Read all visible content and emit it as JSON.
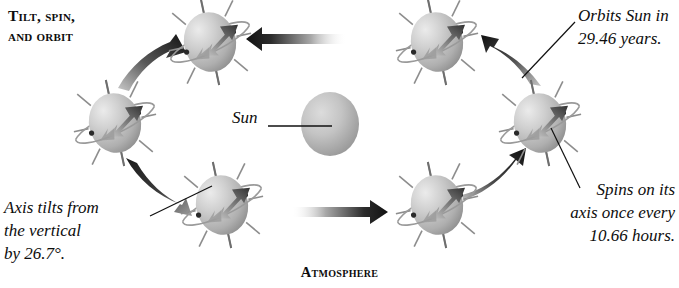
{
  "figure": {
    "section_title": "Tilt, spin,\nand orbit",
    "caption": "Atmosphere",
    "background_color": "#ffffff",
    "text_color": "#0d0d0d"
  },
  "sun": {
    "label": "Sun",
    "center": {
      "x": 330,
      "y": 124
    },
    "radius": 29,
    "fill_light": "#d7d7d7",
    "fill_dark": "#8f8f8f",
    "leader_line": {
      "x1": 268,
      "y1": 126,
      "x2": 330,
      "y2": 126
    }
  },
  "annotations": [
    {
      "name": "orbit-period",
      "text": "Orbits Sun in\n29.46 years.",
      "align": "left",
      "leader_line": {
        "x1": 522,
        "y1": 78,
        "x2": 575,
        "y2": 20
      }
    },
    {
      "name": "spin-period",
      "text": "Spins on its\naxis once every\n10.66 hours.",
      "align": "right",
      "leader_line": {
        "x1": 551,
        "y1": 128,
        "x2": 580,
        "y2": 188
      }
    },
    {
      "name": "axis-tilt",
      "text": "Axis tilts from\nthe vertical\nby 26.7°.",
      "align": "left",
      "leader_line": {
        "x1": 210,
        "y1": 186,
        "x2": 152,
        "y2": 216
      }
    }
  ],
  "planets": [
    {
      "name": "planet-top-left",
      "cx": 210,
      "cy": 42,
      "rx": 26,
      "ry": 30
    },
    {
      "name": "planet-top-right",
      "cx": 437,
      "cy": 42,
      "rx": 26,
      "ry": 30
    },
    {
      "name": "planet-right",
      "cx": 540,
      "cy": 123,
      "rx": 26,
      "ry": 30
    },
    {
      "name": "planet-bottom-right",
      "cx": 437,
      "cy": 205,
      "rx": 26,
      "ry": 30
    },
    {
      "name": "planet-bottom-left",
      "cx": 222,
      "cy": 205,
      "rx": 26,
      "ry": 30
    },
    {
      "name": "planet-left",
      "cx": 115,
      "cy": 123,
      "rx": 26,
      "ry": 30
    }
  ],
  "planet_style": {
    "sphere_light": "#e3e3e3",
    "sphere_mid": "#bfbfbf",
    "sphere_dark": "#8d8d8d",
    "axis_color": "#6e6e6e",
    "spoke_color": "#8a8a8a",
    "ring_color": "#9a9a9a",
    "spin_arrow_dark": "#3a3a3a",
    "spin_arrow_light": "#a8a8a8",
    "axis_tilt_degrees": 26.7
  },
  "orbit_arrows": [
    {
      "name": "orbit-arrow-top",
      "direction": "left",
      "style": "straight",
      "gradient": "dark-at-head-left"
    },
    {
      "name": "orbit-arrow-bottom",
      "direction": "right",
      "style": "straight",
      "gradient": "dark-at-head-right"
    },
    {
      "name": "orbit-arrow-upper-left",
      "direction": "up-right",
      "style": "curved",
      "gradient": "dark-at-head"
    },
    {
      "name": "orbit-arrow-lower-left",
      "direction": "down-right",
      "style": "curved",
      "gradient": "dark-at-head"
    },
    {
      "name": "orbit-arrow-upper-right",
      "direction": "up-left",
      "style": "curved",
      "gradient": "dark-at-head"
    },
    {
      "name": "orbit-arrow-lower-right",
      "direction": "up-right",
      "style": "curved",
      "gradient": "dark-at-head"
    }
  ]
}
